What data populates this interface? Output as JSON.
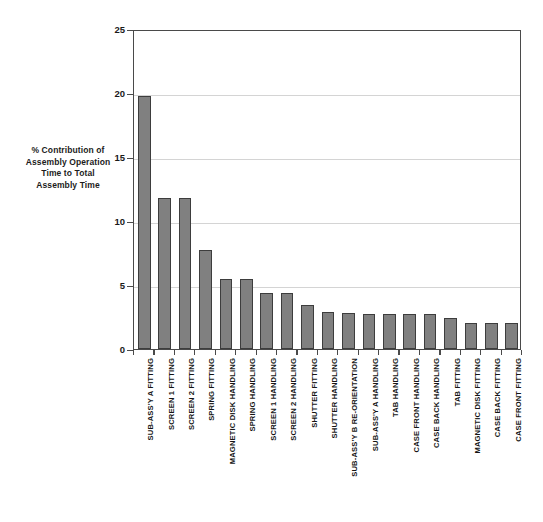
{
  "chart_data": {
    "type": "bar",
    "title": "",
    "subtitle": "",
    "xlabel": "",
    "ylabel": "% Contribution of Assembly Operation Time to Total Assembly Time",
    "ylabel_lines": [
      "% Contribution of",
      "Assembly Operation",
      "Time to Total",
      "Assembly Time"
    ],
    "ylim": [
      0,
      25
    ],
    "ytick_labels": [
      "0",
      "5",
      "10",
      "15",
      "20",
      "25"
    ],
    "ytick_values": [
      0,
      5,
      10,
      15,
      20,
      25
    ],
    "grid": true,
    "grid_axis": "y",
    "legend": false,
    "legend_position": "none",
    "bar_color": "#808080",
    "bar_edge_color": "#3d3d3d",
    "axis_color": "#4a4a4a",
    "gridline_color": "#d4d4d4",
    "background_color": "#ffffff",
    "categories": [
      "SUB-ASS'Y A FITTING",
      "SCREEN 1 FITTING",
      "SCREEN 2 FITTING",
      "SPRING FITTING",
      "MAGNETIC DISK HANDLING",
      "SPRING HANDLING",
      "SCREEN 1 HANDLING",
      "SCREEN 2 HANDLING",
      "SHUTTER FITTING",
      "SHUTTER HANDLING",
      "SUB-ASS'Y B RE-ORIENTATION",
      "SUB-ASS'Y A HANDLING",
      "TAB HANDLING",
      "CASE FRONT HANDLING",
      "CASE BACK HANDLING",
      "TAB FITTING",
      "MAGNETIC DISK FITTING",
      "CASE BACK FITTING",
      "CASE FRONT FITTING"
    ],
    "values": [
      19.8,
      11.8,
      11.8,
      7.7,
      5.5,
      5.5,
      4.4,
      4.4,
      3.4,
      2.9,
      2.8,
      2.7,
      2.7,
      2.7,
      2.7,
      2.4,
      2.0,
      2.0,
      2.0
    ]
  },
  "caption": ""
}
